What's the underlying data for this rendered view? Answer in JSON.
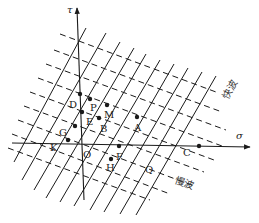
{
  "diagram": {
    "type": "characteristic-lines-stress-plane",
    "axes": {
      "x_label": "σ",
      "y_label": "τ"
    },
    "wave_labels": {
      "fast": "快波",
      "slow": "慢波"
    },
    "points": [
      {
        "id": "D",
        "label": "D"
      },
      {
        "id": "P",
        "label": "P"
      },
      {
        "id": "M",
        "label": "M"
      },
      {
        "id": "E",
        "label": "E"
      },
      {
        "id": "B",
        "label": "B"
      },
      {
        "id": "A",
        "label": "A"
      },
      {
        "id": "G",
        "label": "G"
      },
      {
        "id": "K",
        "label": "K"
      },
      {
        "id": "O",
        "label": "O"
      },
      {
        "id": "F",
        "label": "F"
      },
      {
        "id": "H",
        "label": "H"
      },
      {
        "id": "Q",
        "label": "Q"
      },
      {
        "id": "C",
        "label": "C"
      }
    ],
    "line_styles": {
      "fast_wave_lines": "solid",
      "slow_wave_lines": "dashed"
    },
    "colors": {
      "line": "#1a1a1a",
      "background": "#ffffff"
    }
  }
}
